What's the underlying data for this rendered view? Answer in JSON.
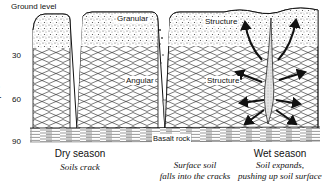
{
  "diagram": {
    "ground_label": "Ground level",
    "axis": {
      "title": "Depth, cm",
      "ticks": [
        "30",
        "60",
        "90"
      ]
    },
    "layers": {
      "granular": "Granular",
      "structure_top": "Structure",
      "angular": "Angular",
      "structure_mid": "Structure",
      "basalt": "Basalt rock"
    },
    "stages": [
      {
        "season": "Dry season",
        "description": "Soils crack"
      },
      {
        "season": "",
        "description_line1": "Surface soil",
        "description_line2": "falls into the cracks"
      },
      {
        "season": "Wet season",
        "description_line1": "Soil expands,",
        "description_line2": "pushing up soil surface"
      }
    ],
    "colors": {
      "ink": "#111111",
      "background": "#ffffff",
      "fill_speckle": "#9a9a9a"
    }
  }
}
